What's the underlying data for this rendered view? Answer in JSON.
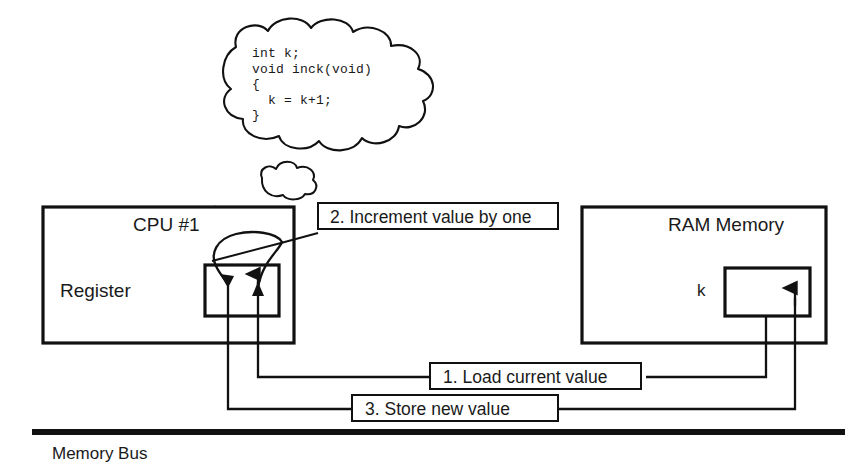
{
  "diagram": {
    "title_semantic": "cpu-register-memory-increment-race-diagram",
    "thought_bubble": {
      "name": "code-thought-bubble",
      "code_lines": [
        "int k;",
        "void inck(void)",
        "{",
        "  k = k+1;",
        "}"
      ]
    },
    "cpu_box": {
      "title": "CPU #1",
      "register_label": "Register"
    },
    "ram_box": {
      "title": "RAM Memory",
      "variable_label": "k"
    },
    "callouts": [
      {
        "id": "step-2",
        "text": "2. Increment value by one"
      },
      {
        "id": "step-1",
        "text": "1. Load current value"
      },
      {
        "id": "step-3",
        "text": "3. Store new value"
      }
    ],
    "bus": {
      "label": "Memory Bus"
    },
    "colors": {
      "ink": "#1a1a1a",
      "stroke": "#111111",
      "background": "#ffffff"
    }
  }
}
